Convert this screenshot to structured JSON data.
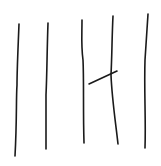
{
  "sketch": {
    "description": "Hand-drawn strokes: five near-vertical lines and one short diagonal crossing the fourth line",
    "background": "#ffffff",
    "stroke_color": "#1a1a1a",
    "stroke_width": 1.6,
    "strokes": [
      {
        "name": "vertical-line-1",
        "d": "M19 24 C18 50 17 70 17 85 C16 100 17 120 15 156"
      },
      {
        "name": "vertical-line-2",
        "d": "M48 23 C47 50 47 75 46 95 C46 115 46 135 46 149"
      },
      {
        "name": "vertical-line-3",
        "d": "M82 20 C82 35 81 45 83 60 C84 80 83 110 84 143"
      },
      {
        "name": "vertical-line-4",
        "d": "M113 16 C112 35 112 55 111 75 C112 100 116 125 118 144"
      },
      {
        "name": "vertical-line-5",
        "d": "M148 14 C147 30 146 45 145 60 C144 90 146 120 145 148"
      },
      {
        "name": "diagonal-line",
        "d": "M89 84 L117 71"
      }
    ]
  }
}
